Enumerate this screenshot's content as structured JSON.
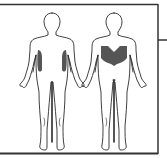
{
  "diagram": {
    "views": [
      {
        "id": "front",
        "label": "Front view",
        "highlight": "side torso (obliques/lats)"
      },
      {
        "id": "back",
        "label": "Back view",
        "highlight": "mid/lower back (latissimus dorsi)"
      }
    ],
    "colors": {
      "outline": "#2a2a2a",
      "highlight": "#555555",
      "frame": "#333333",
      "background": "#ffffff"
    }
  }
}
